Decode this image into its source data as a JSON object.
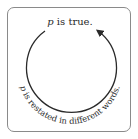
{
  "diagram": {
    "top_label": {
      "variable": "p",
      "text": " is true."
    },
    "bottom_label": {
      "variable": "p",
      "text": " is restated in different words."
    },
    "colors": {
      "stroke": "#2a2a2a",
      "frame": "#8a8a8a",
      "text": "#2a2a2a"
    }
  }
}
